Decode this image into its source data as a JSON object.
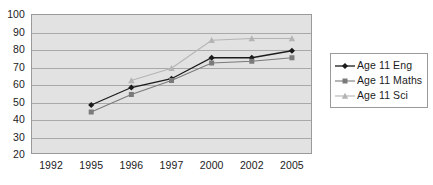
{
  "chart_data": {
    "type": "line",
    "title": "",
    "subtitle": "",
    "xlabel": "",
    "ylabel": "",
    "categories": [
      "1992",
      "1995",
      "1996",
      "1997",
      "2000",
      "2002",
      "2005"
    ],
    "ylim": [
      20,
      100
    ],
    "yticks": [
      100,
      90,
      80,
      70,
      60,
      50,
      40,
      30,
      20
    ],
    "grid": true,
    "legend_position": "right",
    "plot_background": "#e2e2e2",
    "series": [
      {
        "name": "Age 11 Eng",
        "color": "#1b1b1b",
        "marker": "diamond",
        "values": [
          null,
          48,
          58,
          63,
          75,
          75,
          79
        ]
      },
      {
        "name": "Age 11 Maths",
        "color": "#7a7a7a",
        "marker": "square",
        "values": [
          null,
          44,
          54,
          62,
          72,
          73,
          75
        ]
      },
      {
        "name": "Age 11 Sci",
        "color": "#b4b4b4",
        "marker": "triangle",
        "values": [
          null,
          null,
          62,
          69,
          85,
          86,
          86
        ]
      }
    ]
  },
  "legend": {
    "items": [
      {
        "label": "Age 11 Eng"
      },
      {
        "label": "Age 11 Maths"
      },
      {
        "label": "Age 11 Sci"
      }
    ]
  },
  "axes": {
    "y_tick_labels": [
      "100",
      "90",
      "80",
      "70",
      "60",
      "50",
      "40",
      "30",
      "20"
    ],
    "x_tick_labels": [
      "1992",
      "1995",
      "1996",
      "1997",
      "2000",
      "2002",
      "2005"
    ]
  }
}
